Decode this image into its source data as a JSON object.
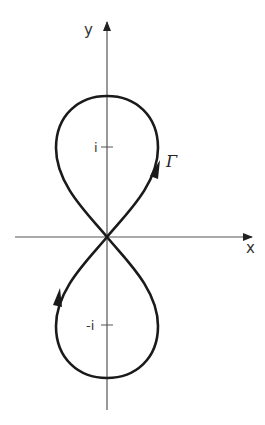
{
  "figure": {
    "axes": {
      "x_label": "x",
      "y_label": "y"
    },
    "ticks": {
      "upper": "i",
      "lower": "-i"
    },
    "curve": {
      "label": "Γ",
      "orientation_arrows": [
        {
          "lobe": "upper",
          "side": "right",
          "direction": "up"
        },
        {
          "lobe": "lower",
          "side": "left",
          "direction": "up"
        }
      ]
    },
    "colors": {
      "curve": "#1a1a1a",
      "axes": "#444444",
      "background": "#ffffff"
    }
  }
}
